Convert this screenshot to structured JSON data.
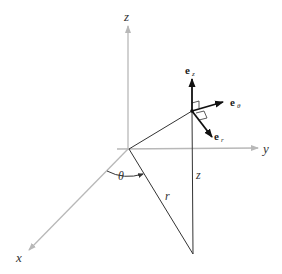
{
  "diagram": {
    "axes": {
      "x": {
        "label": "x"
      },
      "y": {
        "label": "y"
      },
      "z": {
        "label": "z"
      }
    },
    "labels": {
      "angle": "θ",
      "radius": "r",
      "height": "z"
    },
    "vectors": [
      {
        "name": "e",
        "subscript": "z"
      },
      {
        "name": "e",
        "subscript": "θ"
      },
      {
        "name": "e",
        "subscript": "r"
      }
    ],
    "colors": {
      "axis": "#b8b8b8",
      "line": "#333333",
      "vector": "#111111",
      "background": "#ffffff"
    }
  }
}
